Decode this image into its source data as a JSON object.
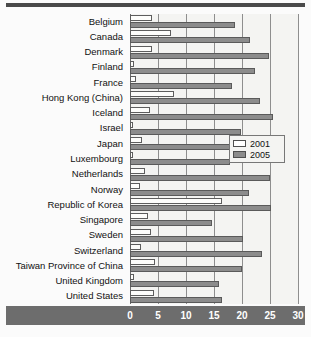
{
  "figure": {
    "background_color": "#f4f4f2",
    "bar_2001_color": "#ffffff",
    "bar_2005_color": "#8c8c8c",
    "axis_band_color": "#6d6d6d"
  },
  "legend": {
    "position": "inside-right-middle",
    "entries": [
      {
        "label": "2001",
        "swatch": "white-outline-swatch"
      },
      {
        "label": "2005",
        "swatch": "gray-filled-swatch"
      }
    ]
  },
  "chart_data": {
    "type": "bar",
    "orientation": "horizontal",
    "title": "",
    "subtitle": "",
    "xlabel": "",
    "ylabel": "",
    "xlim": [
      0,
      30
    ],
    "ylim": null,
    "grid": true,
    "grid_axis": "x",
    "legend_position": "inside right",
    "xticks": [
      0,
      5,
      10,
      15,
      20,
      25,
      30
    ],
    "xtick_labels": [
      "0",
      "5",
      "10",
      "15",
      "20",
      "25",
      "30"
    ],
    "categories": [
      "Belgium",
      "Canada",
      "Denmark",
      "Finland",
      "France",
      "Hong Kong (China)",
      "Iceland",
      "Israel",
      "Japan",
      "Luxembourg",
      "Netherlands",
      "Norway",
      "Republic of Korea",
      "Singapore",
      "Sweden",
      "Switzerland",
      "Taiwan Province of China",
      "United Kingdom",
      "United States"
    ],
    "series": [
      {
        "name": "2001",
        "color": "#ffffff",
        "values": [
          4.0,
          7.3,
          4.0,
          0.7,
          1.0,
          7.8,
          3.5,
          0.5,
          2.2,
          0.5,
          2.6,
          1.8,
          16.5,
          3.3,
          3.8,
          1.9,
          4.5,
          0.8,
          4.2
        ]
      },
      {
        "name": "2005",
        "color": "#8c8c8c",
        "values": [
          18.7,
          21.5,
          24.8,
          22.4,
          18.3,
          23.2,
          25.5,
          19.8,
          19.8,
          17.8,
          25.0,
          21.2,
          25.1,
          14.6,
          20.2,
          23.5,
          20.0,
          15.9,
          16.4
        ]
      }
    ]
  }
}
